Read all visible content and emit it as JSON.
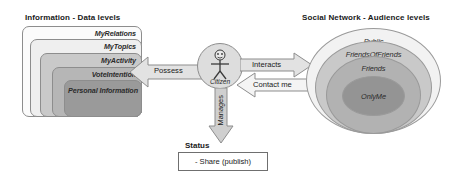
{
  "diagram": {
    "left_section": {
      "title": "Information - Data levels",
      "levels": [
        {
          "label": "MyRelations",
          "color": "#fbfbfb"
        },
        {
          "label": "MyTopics",
          "color": "#efefef"
        },
        {
          "label": "MyActivity",
          "color": "#c9c9c9"
        },
        {
          "label": "VoteIntention",
          "color": "#b6b6b6"
        },
        {
          "label": "Personal Information",
          "color": "#9a9a9a"
        }
      ]
    },
    "actor": {
      "label": "Citizen",
      "icon": "stick-figure-actor-icon",
      "fill": "#dddddd"
    },
    "relations": [
      {
        "label": "Possess",
        "direction": "left"
      },
      {
        "label": "Interacts",
        "direction": "right"
      },
      {
        "label": "Contact me",
        "direction": "left"
      },
      {
        "label": "Manages",
        "direction": "down"
      }
    ],
    "status": {
      "title": "Status",
      "items": "- Share (publish)"
    },
    "right_section": {
      "title": "Social Network - Audience levels",
      "levels": [
        {
          "label": "Public",
          "color": "#f2f2f2"
        },
        {
          "label": "FriendsOfFriends",
          "color": "#c9c9c9"
        },
        {
          "label": "Friends",
          "color": "#b2b2b2"
        },
        {
          "label": "OnlyMe",
          "color": "#949494"
        }
      ]
    },
    "colors": {
      "stroke": "#8d8d8d",
      "text": "#1a1a1a",
      "background": "#ffffff"
    }
  }
}
